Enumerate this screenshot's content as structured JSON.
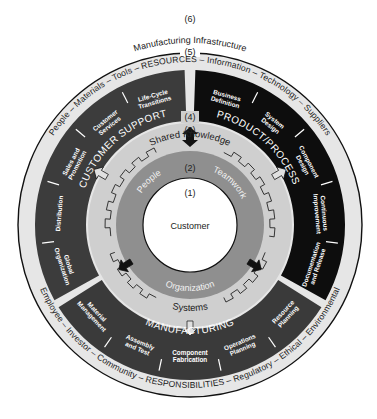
{
  "labels": {
    "level6": "(6)",
    "level5": "(5)",
    "level4": "(4)",
    "level3": "(3)",
    "level2": "(2)",
    "level1": "(1)",
    "manufacturing_infrastructure": "Manufacturing Infrastructure"
  },
  "resources_ring": "People – Materials – Tools – RESOURCES – Information – Technology – Suppliers",
  "responsibilities_ring": "Employee – Investor – Community – RESPONSIBILITIES – Regulatory – Ethical – Environmental",
  "sectors": {
    "customer_support": {
      "title": "CUSTOMER SUPPORT",
      "segments": [
        [
          "Global",
          "Organization"
        ],
        [
          "Distribution"
        ],
        [
          "Sales and",
          "Promotion"
        ],
        [
          "Customer",
          "Services"
        ],
        [
          "Life-Cycle",
          "Transitions"
        ]
      ]
    },
    "product_process": {
      "title": "PRODUCT/PROCESS",
      "segments": [
        [
          "Business",
          "Definition"
        ],
        [
          "System",
          "Design"
        ],
        [
          "Component",
          "Design"
        ],
        [
          "Continuous",
          "Improvement"
        ],
        [
          "Documentation",
          "and Release"
        ]
      ]
    },
    "manufacturing": {
      "title": "MANUFACTURING",
      "segments": [
        [
          "Resource",
          "Planning"
        ],
        [
          "Operations",
          "Planning"
        ],
        [
          "Component",
          "Fabrication"
        ],
        [
          "Assembly",
          "and Test"
        ],
        [
          "Material",
          "Management"
        ]
      ]
    }
  },
  "ring3": {
    "top": "Shared Knowledge",
    "bottom": "Systems"
  },
  "ring2": {
    "left": "People",
    "right": "Teamwork",
    "bottom": "Organization"
  },
  "center": {
    "label": "Customer"
  },
  "colors": {
    "outer_band": "#e6e6e6",
    "customer_support": "#3c3c3c",
    "product_process": "#0d0d0d",
    "manufacturing": "#3a3a3a",
    "ring3": "#cfcfcf",
    "ring2": "#8f8f8f",
    "center": "#ffffff",
    "line": "#111111"
  }
}
